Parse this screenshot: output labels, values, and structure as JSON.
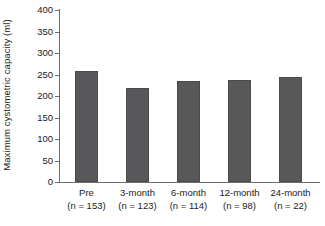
{
  "chart_data": {
    "type": "bar",
    "title": "",
    "xlabel": "",
    "ylabel": "Maximum cystometric capacity (ml)",
    "categories": [
      "Pre",
      "3-month",
      "6-month",
      "12-month",
      "24-month"
    ],
    "group_sizes": [
      "(n = 153)",
      "(n = 123)",
      "(n = 114)",
      "(n = 98)",
      "(n = 22)"
    ],
    "values": [
      259,
      219,
      235,
      238,
      245
    ],
    "ylim": [
      0,
      400
    ],
    "yticks": [
      0,
      50,
      100,
      150,
      200,
      250,
      300,
      350,
      400
    ],
    "ytick_labels": [
      "0",
      "50",
      "100",
      "150",
      "200",
      "250",
      "300",
      "350",
      "400"
    ],
    "grid": false,
    "legend": null,
    "bar_color": "#58585a",
    "axis_color": "#6e6e6e",
    "text_color": "#1a1a1a"
  }
}
